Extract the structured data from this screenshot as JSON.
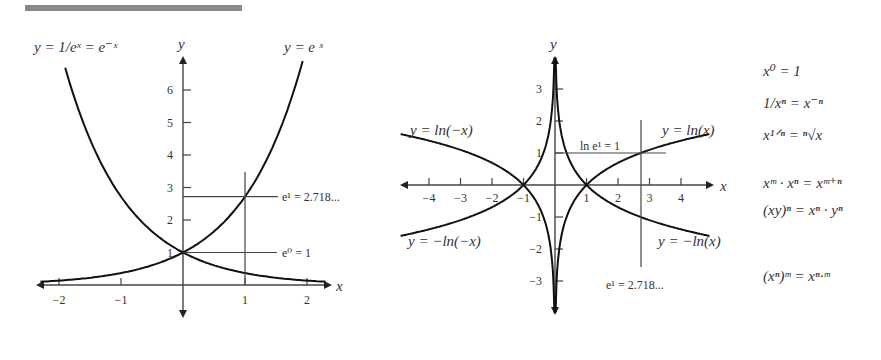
{
  "header_bar": {
    "color": "#8a8a8a"
  },
  "left_chart": {
    "title_left": "y = 1/eˣ = e⁻ˣ",
    "title_right": "y = e ˣ",
    "axis_labels": {
      "x": "x",
      "y": "y"
    },
    "x_ticks": [
      "−2",
      "−1",
      "1",
      "2"
    ],
    "y_ticks": [
      "1",
      "2",
      "3",
      "4",
      "5",
      "6"
    ],
    "annotations": {
      "e1": "e¹ = 2.718...",
      "e0": "e⁰ = 1"
    }
  },
  "right_chart": {
    "labels": {
      "ln_neg": "y = ln(−x)",
      "ln_pos": "y = ln(x)",
      "neg_ln_neg": "y = −ln(−x)",
      "neg_ln_pos": "y = −ln(x)",
      "ln_e1": "ln e¹ = 1",
      "e1": "e¹ = 2.718..."
    },
    "axis_labels": {
      "x": "x",
      "y": "y"
    },
    "x_ticks": [
      "−4",
      "−3",
      "−2",
      "−1",
      "1",
      "2",
      "3",
      "4"
    ],
    "y_ticks": [
      "3",
      "2",
      "1",
      "−1",
      "−2",
      "−3"
    ]
  },
  "formulas": [
    "x⁰ = 1",
    "1/xⁿ = x⁻ⁿ",
    "x¹ᐟⁿ = ⁿ√x",
    "xᵐ · xⁿ = xᵐ⁺ⁿ",
    "(xy)ⁿ = xⁿ · yⁿ",
    "(xⁿ)ᵐ = xⁿ·ᵐ"
  ],
  "chart_data": [
    {
      "type": "line",
      "title": "Exponential functions",
      "xlabel": "x",
      "ylabel": "y",
      "xlim": [
        -2.4,
        2.4
      ],
      "ylim": [
        -0.9,
        7
      ],
      "series": [
        {
          "name": "y = e^x",
          "x": [
            -2.3,
            -2,
            -1,
            0,
            1,
            1.5,
            1.92
          ],
          "y": [
            0.1,
            0.135,
            0.368,
            1,
            2.718,
            4.48,
            6.8
          ]
        },
        {
          "name": "y = e^-x",
          "x": [
            -1.89,
            -1.5,
            -1,
            0,
            1,
            2,
            2.3
          ],
          "y": [
            6.6,
            4.48,
            2.718,
            1,
            0.368,
            0.135,
            0.1
          ]
        }
      ],
      "annotations": [
        "e^1 = 2.718...",
        "e^0 = 1"
      ]
    },
    {
      "type": "line",
      "title": "Logarithmic functions",
      "xlabel": "x",
      "ylabel": "y",
      "xlim": [
        -4.9,
        4.9
      ],
      "ylim": [
        -3.9,
        3.9
      ],
      "series": [
        {
          "name": "y = ln(x)",
          "x": [
            0.03,
            0.5,
            1,
            2,
            2.718,
            4.9
          ],
          "y": [
            -3.5,
            -0.69,
            0,
            0.69,
            1,
            1.59
          ]
        },
        {
          "name": "y = -ln(x)",
          "x": [
            0.03,
            0.5,
            1,
            2,
            2.718,
            4.9
          ],
          "y": [
            3.5,
            0.69,
            0,
            -0.69,
            -1,
            -1.59
          ]
        },
        {
          "name": "y = ln(-x)",
          "x": [
            -4.9,
            -2,
            -1,
            -0.5,
            -0.03
          ],
          "y": [
            1.59,
            0.69,
            0,
            -0.69,
            -3.5
          ]
        },
        {
          "name": "y = -ln(-x)",
          "x": [
            -4.9,
            -2,
            -1,
            -0.5,
            -0.03
          ],
          "y": [
            -1.59,
            -0.69,
            0,
            0.69,
            3.5
          ]
        }
      ],
      "annotations": [
        "ln e^1 = 1",
        "e^1 = 2.718..."
      ]
    }
  ]
}
